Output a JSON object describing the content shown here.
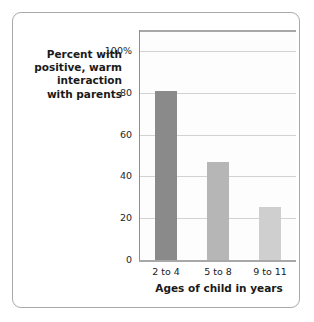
{
  "chart_data": {
    "type": "bar",
    "title": "",
    "categories": [
      "2 to 4",
      "5 to 8",
      "9 to 11"
    ],
    "values": [
      81,
      47,
      25.5
    ],
    "series": [
      {
        "name": "Percent with positive, warm interaction with parents",
        "values": [
          81,
          47,
          25.5
        ]
      }
    ],
    "xlabel": "Ages of child in years",
    "ylabel": "Percent with positive, warm interaction with parents",
    "ylim": [
      0,
      110
    ],
    "ytick_values": [
      0,
      20,
      40,
      60,
      80,
      100
    ],
    "ytick_labels": [
      "0",
      "20",
      "40",
      "60",
      "80",
      "100%"
    ],
    "grid": "horizontal",
    "legend": "none",
    "bar_colors": [
      "#8a8a8a",
      "#b6b6b6",
      "#cfcfcf"
    ]
  },
  "y_axis_caption": {
    "lines": [
      "Percent with",
      "positive, warm",
      "interaction",
      "with parents"
    ]
  },
  "axis": {
    "x_title": "Ages of child in years"
  },
  "colors": {
    "frame": "#a9a9a9",
    "gridline": "#d2d2d2",
    "spine": "#a8a8a8",
    "plot_background": "#fdfdfd",
    "text": "#1a1a1a"
  }
}
